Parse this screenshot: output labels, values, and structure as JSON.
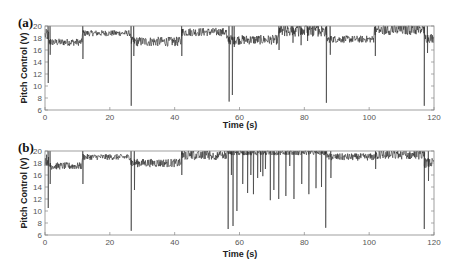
{
  "chart_data": [
    {
      "type": "line",
      "panel_label": "(a)",
      "xlabel": "Time (s)",
      "ylabel": "Pitch Control (V)",
      "xlim": [
        0,
        120
      ],
      "ylim": [
        6,
        20
      ],
      "xticks": [
        0,
        20,
        40,
        60,
        80,
        100,
        120
      ],
      "yticks": [
        6,
        8,
        10,
        12,
        14,
        16,
        18,
        20
      ],
      "grid": false,
      "segments": [
        {
          "start": 0,
          "end": 1,
          "mean": 18.5,
          "noise": 1.0
        },
        {
          "start": 1,
          "end": 11.5,
          "mean": 17.3,
          "noise": 0.6
        },
        {
          "start": 11.5,
          "end": 26.5,
          "mean": 18.8,
          "noise": 0.5
        },
        {
          "start": 26.5,
          "end": 42,
          "mean": 17.4,
          "noise": 0.8
        },
        {
          "start": 42,
          "end": 56,
          "mean": 19.0,
          "noise": 0.7
        },
        {
          "start": 56,
          "end": 72,
          "mean": 17.7,
          "noise": 0.8
        },
        {
          "start": 72,
          "end": 87,
          "mean": 19.2,
          "noise": 1.0
        },
        {
          "start": 87,
          "end": 101.5,
          "mean": 17.8,
          "noise": 0.6
        },
        {
          "start": 101.5,
          "end": 117,
          "mean": 19.3,
          "noise": 0.8
        },
        {
          "start": 117,
          "end": 120,
          "mean": 18.0,
          "noise": 0.8
        }
      ],
      "spikes": [
        {
          "x": 1.0,
          "min": 10.5
        },
        {
          "x": 1.6,
          "min": 15.2
        },
        {
          "x": 11.7,
          "min": 14.5
        },
        {
          "x": 26.6,
          "min": 6.7
        },
        {
          "x": 27.4,
          "min": 15.0
        },
        {
          "x": 42.2,
          "min": 15.0
        },
        {
          "x": 56.8,
          "min": 7.4
        },
        {
          "x": 57.8,
          "min": 8.5
        },
        {
          "x": 58.4,
          "min": 16.5
        },
        {
          "x": 72.2,
          "min": 16.0
        },
        {
          "x": 76.5,
          "min": 17.2
        },
        {
          "x": 79.0,
          "min": 16.8
        },
        {
          "x": 81.0,
          "min": 17.5
        },
        {
          "x": 86.8,
          "min": 7.2
        },
        {
          "x": 88.0,
          "min": 15.2
        },
        {
          "x": 101.9,
          "min": 15.0
        },
        {
          "x": 117.0,
          "min": 6.7
        },
        {
          "x": 118.0,
          "min": 15.5
        }
      ]
    },
    {
      "type": "line",
      "panel_label": "(b)",
      "xlabel": "Time (s)",
      "ylabel": "Pitch Control (V)",
      "xlim": [
        0,
        120
      ],
      "ylim": [
        6,
        20
      ],
      "xticks": [
        0,
        20,
        40,
        60,
        80,
        100,
        120
      ],
      "yticks": [
        6,
        8,
        10,
        12,
        14,
        16,
        18,
        20
      ],
      "grid": false,
      "segments": [
        {
          "start": 0,
          "end": 1,
          "mean": 18.5,
          "noise": 1.0
        },
        {
          "start": 1,
          "end": 11.5,
          "mean": 17.5,
          "noise": 0.6
        },
        {
          "start": 11.5,
          "end": 26.5,
          "mean": 19.0,
          "noise": 0.5
        },
        {
          "start": 26.5,
          "end": 42,
          "mean": 18.0,
          "noise": 0.7
        },
        {
          "start": 42,
          "end": 56,
          "mean": 19.2,
          "noise": 0.7
        },
        {
          "start": 56,
          "end": 87,
          "mean": 19.7,
          "noise": 0.4
        },
        {
          "start": 87,
          "end": 101.5,
          "mean": 19.0,
          "noise": 0.6
        },
        {
          "start": 101.5,
          "end": 117,
          "mean": 19.3,
          "noise": 0.7
        },
        {
          "start": 117,
          "end": 120,
          "mean": 18.0,
          "noise": 0.8
        }
      ],
      "spikes": [
        {
          "x": 1.0,
          "min": 10.5
        },
        {
          "x": 1.6,
          "min": 14.5
        },
        {
          "x": 11.7,
          "min": 14.5
        },
        {
          "x": 26.6,
          "min": 6.7
        },
        {
          "x": 27.6,
          "min": 13.5
        },
        {
          "x": 42.2,
          "min": 16.0
        },
        {
          "x": 56.5,
          "min": 7.0
        },
        {
          "x": 57.5,
          "min": 16.0
        },
        {
          "x": 58.0,
          "min": 7.5
        },
        {
          "x": 59.2,
          "min": 10.0
        },
        {
          "x": 61.0,
          "min": 14.5
        },
        {
          "x": 62.5,
          "min": 13.0
        },
        {
          "x": 63.5,
          "min": 16.0
        },
        {
          "x": 64.3,
          "min": 12.8
        },
        {
          "x": 65.6,
          "min": 15.5
        },
        {
          "x": 66.5,
          "min": 16.5
        },
        {
          "x": 67.2,
          "min": 15.8
        },
        {
          "x": 68.0,
          "min": 17.0
        },
        {
          "x": 69.5,
          "min": 11.8
        },
        {
          "x": 70.6,
          "min": 13.5
        },
        {
          "x": 72.1,
          "min": 12.0
        },
        {
          "x": 74.3,
          "min": 12.5
        },
        {
          "x": 75.5,
          "min": 17.5
        },
        {
          "x": 76.8,
          "min": 12.0
        },
        {
          "x": 79.2,
          "min": 14.5
        },
        {
          "x": 81.4,
          "min": 12.8
        },
        {
          "x": 83.6,
          "min": 13.8
        },
        {
          "x": 85.3,
          "min": 14.0
        },
        {
          "x": 86.6,
          "min": 7.2
        },
        {
          "x": 88.2,
          "min": 15.5
        },
        {
          "x": 102.0,
          "min": 17.0
        },
        {
          "x": 117.0,
          "min": 7.0
        },
        {
          "x": 118.3,
          "min": 15.0
        }
      ]
    }
  ],
  "panels": [
    {
      "label": "(a)",
      "xlabel": "Time (s)",
      "ylabel": "Pitch Control (V)"
    },
    {
      "label": "(b)",
      "xlabel": "Time (s)",
      "ylabel": "Pitch Control (V)"
    }
  ],
  "colors": {
    "trace": "#2a2a2a",
    "axis": "#888888",
    "tick_label": "#555555"
  }
}
